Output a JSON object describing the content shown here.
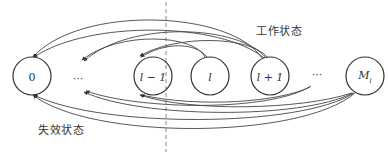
{
  "diagram": {
    "type": "state-transition",
    "labels": {
      "working_state": "工作状态",
      "failure_state": "失效状态"
    },
    "nodes": [
      {
        "id": "n0",
        "label": "0",
        "italic": false,
        "cx": 32,
        "cy": 76,
        "r": 19
      },
      {
        "id": "nl_minus_1",
        "label": "l − 1",
        "italic": true,
        "cx": 153,
        "cy": 76,
        "r": 19
      },
      {
        "id": "nl",
        "label": "l",
        "italic": true,
        "cx": 210,
        "cy": 76,
        "r": 19
      },
      {
        "id": "nl_plus_1",
        "label": "l + 1",
        "italic": true,
        "cx": 270,
        "cy": 76,
        "r": 19
      },
      {
        "id": "nMi",
        "label": "M",
        "subscript": "i",
        "italic": true,
        "cx": 365,
        "cy": 76,
        "r": 19
      }
    ],
    "ellipses": [
      {
        "id": "dots-left",
        "text": "···",
        "x": 78,
        "y": 76
      },
      {
        "id": "dots-right",
        "text": "···",
        "x": 317,
        "y": 76
      }
    ],
    "divider": {
      "x": 166,
      "y1": 0,
      "y2": 154,
      "style": "dashed"
    },
    "colors": {
      "stroke": "#333333",
      "divider": "#888888",
      "background": "#ffffff"
    }
  }
}
